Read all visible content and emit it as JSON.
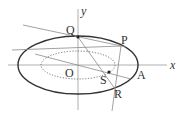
{
  "diagram": {
    "title": "",
    "axes": {
      "x_label": "x",
      "y_label": "y",
      "origin_label": "O"
    },
    "curves": [
      {
        "name": "outer-ellipse",
        "style": "solid",
        "cx": 78,
        "cy": 65,
        "rx": 60,
        "ry": 29
      },
      {
        "name": "inner-ellipse",
        "style": "dotted",
        "cx": 78,
        "cy": 65,
        "rx": 37,
        "ry": 14
      }
    ],
    "points": {
      "Q": {
        "label": "Q",
        "x": 78,
        "y": 37
      },
      "P": {
        "label": "P",
        "x": 120,
        "y": 46
      },
      "S": {
        "label": "S",
        "x": 109,
        "y": 72
      },
      "R": {
        "label": "R",
        "x": 116,
        "y": 88
      },
      "A": {
        "label": "A",
        "x": 138,
        "y": 65
      }
    },
    "colors": {
      "curve": "#333333",
      "line": "#8a8a8a",
      "axis": "#9a9a9a",
      "text": "#333333"
    }
  }
}
